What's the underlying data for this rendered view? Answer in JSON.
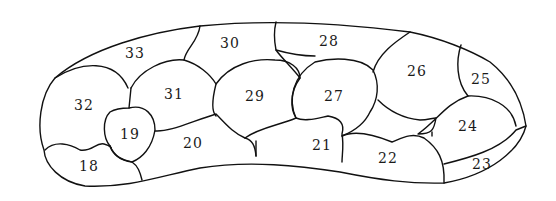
{
  "diagram": {
    "type": "segmented-region-map",
    "regions": [
      {
        "id": "18",
        "label": "18",
        "x": 89,
        "y": 166
      },
      {
        "id": "19",
        "label": "19",
        "x": 130,
        "y": 134
      },
      {
        "id": "20",
        "label": "20",
        "x": 193,
        "y": 143
      },
      {
        "id": "21",
        "label": "21",
        "x": 322,
        "y": 145
      },
      {
        "id": "22",
        "label": "22",
        "x": 388,
        "y": 158
      },
      {
        "id": "23",
        "label": "23",
        "x": 482,
        "y": 164
      },
      {
        "id": "24",
        "label": "24",
        "x": 468,
        "y": 126
      },
      {
        "id": "25",
        "label": "25",
        "x": 481,
        "y": 79
      },
      {
        "id": "26",
        "label": "26",
        "x": 417,
        "y": 71
      },
      {
        "id": "27",
        "label": "27",
        "x": 334,
        "y": 96
      },
      {
        "id": "28",
        "label": "28",
        "x": 329,
        "y": 41
      },
      {
        "id": "29",
        "label": "29",
        "x": 255,
        "y": 96
      },
      {
        "id": "30",
        "label": "30",
        "x": 230,
        "y": 43
      },
      {
        "id": "31",
        "label": "31",
        "x": 174,
        "y": 94
      },
      {
        "id": "32",
        "label": "32",
        "x": 84,
        "y": 105
      },
      {
        "id": "33",
        "label": "33",
        "x": 135,
        "y": 53
      }
    ]
  }
}
